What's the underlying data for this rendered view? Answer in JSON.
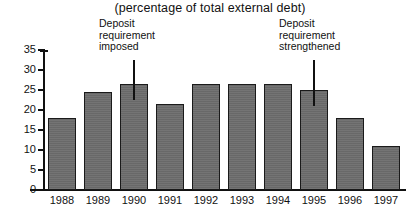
{
  "chart_data": {
    "type": "bar",
    "title": "(percentage of total external debt)",
    "xlabel": "",
    "ylabel": "",
    "categories": [
      "1988",
      "1989",
      "1990",
      "1991",
      "1992",
      "1993",
      "1994",
      "1995",
      "1996",
      "1997"
    ],
    "values": [
      18,
      24.5,
      26.5,
      21.5,
      26.5,
      26.5,
      26.5,
      25,
      18,
      11
    ],
    "ylim": [
      0,
      35
    ],
    "yticks": [
      0,
      5,
      10,
      15,
      20,
      25,
      30,
      35
    ],
    "ytick_labels": [
      "0",
      "5",
      "10",
      "15",
      "20",
      "25",
      "30",
      "35"
    ],
    "grid": false,
    "legend": null,
    "bar_color": "#6e6e6e",
    "bar_border_color": "#1a1a1a",
    "axis_color": "#111111",
    "annotations": [
      {
        "text_lines": [
          "Deposit",
          "requirement",
          "imposed"
        ],
        "at_category": "1990",
        "marker": "vertical-line"
      },
      {
        "text_lines": [
          "Deposit",
          "requirement",
          "strengthened"
        ],
        "at_category": "1995",
        "marker": "vertical-line"
      }
    ]
  }
}
